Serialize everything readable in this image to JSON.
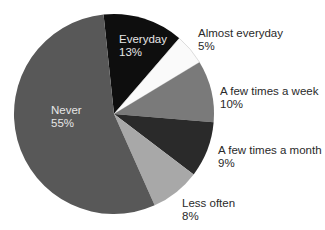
{
  "chart_data": {
    "type": "pie",
    "title": "",
    "start_angle_deg": -6,
    "direction": "clockwise",
    "slices": [
      {
        "label": "Everyday",
        "value": 13,
        "display": "13%",
        "color": "#0e0e0e",
        "label_position": "inside"
      },
      {
        "label": "Almost everyday",
        "value": 5,
        "display": "5%",
        "color": "#fafafa",
        "label_position": "outside"
      },
      {
        "label": "A few times a week",
        "value": 10,
        "display": "10%",
        "color": "#7a7a7a",
        "label_position": "outside"
      },
      {
        "label": "A few times a month",
        "value": 9,
        "display": "9%",
        "color": "#2a2a2a",
        "label_position": "outside"
      },
      {
        "label": "Less often",
        "value": 8,
        "display": "8%",
        "color": "#a8a8a8",
        "label_position": "outside"
      },
      {
        "label": "Never",
        "value": 55,
        "display": "55%",
        "color": "#585858",
        "label_position": "inside"
      }
    ],
    "legend": "none",
    "grid": false
  },
  "labels": {
    "everyday": {
      "name": "Everyday",
      "pct": "13%"
    },
    "almost_everyday": {
      "name": "Almost everyday",
      "pct": "5%"
    },
    "few_week": {
      "name": "A few times a week",
      "pct": "10%"
    },
    "few_month": {
      "name": "A few times a month",
      "pct": "9%"
    },
    "less_often": {
      "name": "Less often",
      "pct": "8%"
    },
    "never": {
      "name": "Never",
      "pct": "55%"
    }
  }
}
